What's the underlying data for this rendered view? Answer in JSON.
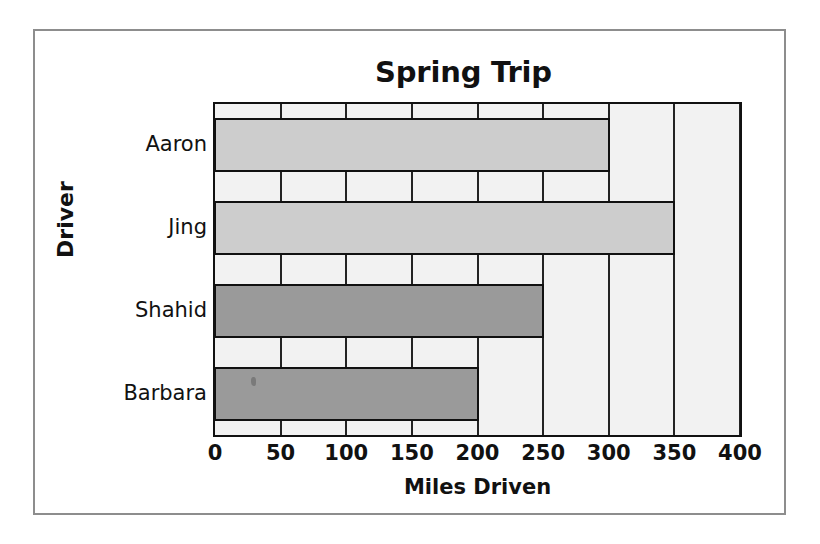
{
  "chart_data": {
    "type": "bar",
    "orientation": "horizontal",
    "title": "Spring Trip",
    "xlabel": "Miles Driven",
    "ylabel": "Driver",
    "categories": [
      "Aaron",
      "Jing",
      "Shahid",
      "Barbara"
    ],
    "values": [
      300,
      350,
      250,
      200
    ],
    "bar_colors": [
      "#cdcdcd",
      "#cdcdcd",
      "#9a9a9a",
      "#9a9a9a"
    ],
    "xlim": [
      0,
      400
    ],
    "xticks": [
      0,
      50,
      100,
      150,
      200,
      250,
      300,
      350,
      400
    ],
    "xtick_labels": [
      "0",
      "50",
      "100",
      "150",
      "200",
      "250",
      "300",
      "350",
      "400"
    ],
    "grid": true,
    "grid_axis": "x",
    "legend": "none",
    "plot_background": "#f2f2f2",
    "axis_color": "#111111",
    "frame_color": "#8d8d8d",
    "page_background": "#ffffff"
  }
}
